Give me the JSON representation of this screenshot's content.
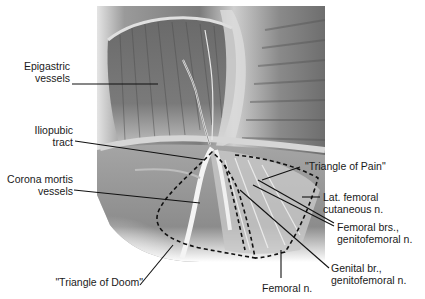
{
  "figure": {
    "type": "anatomical illustration",
    "palette": {
      "background": "#ffffff",
      "illustration_dark": "#5a5a5a",
      "illustration_mid": "#9a9a9a",
      "illustration_light": "#d8d8d8",
      "leader_line": "#111111"
    }
  },
  "labels": {
    "epigastric": {
      "line1": "Epigastric",
      "line2": "vessels"
    },
    "iliopubic": {
      "line1": "Iliopubic",
      "line2": "tract"
    },
    "corona": {
      "line1": "Corona mortis",
      "line2": "vessels"
    },
    "doom": {
      "line1": "\"Triangle of Doom\""
    },
    "pain": {
      "line1": "\"Triangle of Pain\""
    },
    "lat_femoral": {
      "line1": "Lat. femoral",
      "line2": "cutaneous n."
    },
    "femoral_brs": {
      "line1": "Femoral brs.,",
      "line2": "genitofemoral n."
    },
    "genital_br": {
      "line1": "Genital br.,",
      "line2": "genitofemoral n."
    },
    "femoral_n": {
      "line1": "Femoral n."
    }
  }
}
